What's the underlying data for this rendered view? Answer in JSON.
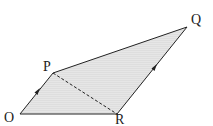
{
  "diagram": {
    "type": "vector-quadrilateral",
    "points": {
      "O": {
        "label": "O",
        "x": 20,
        "y": 114
      },
      "P": {
        "label": "P",
        "x": 53,
        "y": 73
      },
      "Q": {
        "label": "Q",
        "x": 187,
        "y": 27
      },
      "R": {
        "label": "R",
        "x": 117,
        "y": 114
      }
    },
    "edges": [
      {
        "from": "O",
        "to": "P",
        "style": "solid",
        "arrow": true
      },
      {
        "from": "P",
        "to": "Q",
        "style": "solid",
        "arrow": false
      },
      {
        "from": "Q",
        "to": "R",
        "style": "solid",
        "arrow": false
      },
      {
        "from": "R",
        "to": "Q",
        "style": "solid",
        "arrow": true
      },
      {
        "from": "O",
        "to": "R",
        "style": "solid",
        "arrow": false
      },
      {
        "from": "P",
        "to": "R",
        "style": "dashed",
        "arrow": false
      }
    ],
    "colors": {
      "fill": "#e4e4e4",
      "stroke": "#222222"
    }
  }
}
